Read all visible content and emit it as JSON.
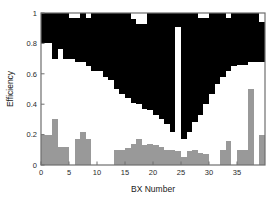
{
  "chart_data": {
    "type": "bar",
    "title": "",
    "subtitle": "",
    "xlabel": "BX Number",
    "ylabel": "Efficiency",
    "xlim": [
      0,
      40
    ],
    "ylim": [
      0,
      1.0
    ],
    "xticks": [
      0,
      5,
      10,
      15,
      20,
      25,
      30,
      35
    ],
    "xtick_labels": [
      "0",
      "5",
      "10",
      "15",
      "20",
      "25",
      "30",
      "35"
    ],
    "yticks": [
      0,
      0.2,
      0.4,
      0.6,
      0.8,
      1
    ],
    "ytick_labels": [
      "0",
      "0.2",
      "0.4",
      "0.6",
      "0.8",
      "1"
    ],
    "grid": false,
    "legend_position": "none",
    "stacked": true,
    "bar_width": 1,
    "colors": {
      "series_gray": "#999999",
      "series_white": "#ffffff",
      "series_black": "#000000",
      "axis": "#6e6e6e",
      "text": "#222222",
      "background": "#ffffff"
    },
    "categories": [
      0,
      1,
      2,
      3,
      4,
      5,
      6,
      7,
      8,
      9,
      10,
      11,
      12,
      13,
      14,
      15,
      16,
      17,
      18,
      19,
      20,
      21,
      22,
      23,
      24,
      25,
      26,
      27,
      28,
      29,
      30,
      31,
      32,
      33,
      34,
      35,
      36,
      37,
      38,
      39
    ],
    "series": [
      {
        "name": "lower-gray-band",
        "color": "#999999",
        "description": "gray filled region measured from y=0 upward",
        "values": [
          0.2,
          0.2,
          0.3,
          0.12,
          0.12,
          0.0,
          0.17,
          0.22,
          0.17,
          0.0,
          0.0,
          0.0,
          0.0,
          0.1,
          0.1,
          0.11,
          0.14,
          0.17,
          0.13,
          0.14,
          0.13,
          0.12,
          0.1,
          0.1,
          0.09,
          0.05,
          0.09,
          0.1,
          0.08,
          0.07,
          0.0,
          0.0,
          0.1,
          0.16,
          0.0,
          0.1,
          0.1,
          0.5,
          0.0,
          0.2
        ]
      },
      {
        "name": "upper-black-band-bottom",
        "color": "#000000",
        "description": "lower boundary of black region (efficiency value where black begins)",
        "values": [
          0.8,
          0.8,
          0.7,
          0.76,
          0.7,
          0.7,
          0.68,
          0.68,
          0.65,
          0.62,
          0.62,
          0.58,
          0.56,
          0.5,
          0.47,
          0.44,
          0.41,
          0.4,
          0.37,
          0.36,
          0.33,
          0.3,
          0.27,
          0.22,
          0.91,
          0.17,
          0.22,
          0.28,
          0.33,
          0.4,
          0.47,
          0.53,
          0.58,
          0.62,
          0.65,
          0.66,
          0.66,
          0.68,
          0.68,
          0.68
        ]
      },
      {
        "name": "upper-black-band-top",
        "color": "#000000",
        "description": "upper boundary of black region (top of stack)",
        "values": [
          1.0,
          1.0,
          1.0,
          1.0,
          1.0,
          0.97,
          0.97,
          1.0,
          0.97,
          1.0,
          1.0,
          1.0,
          1.0,
          1.0,
          1.0,
          1.0,
          0.96,
          0.93,
          0.93,
          1.0,
          1.0,
          1.0,
          1.0,
          1.0,
          1.0,
          1.0,
          1.0,
          1.0,
          0.97,
          0.97,
          1.0,
          1.0,
          1.0,
          0.97,
          1.0,
          1.0,
          1.0,
          1.0,
          1.0,
          0.94
        ]
      }
    ],
    "annotations": [
      {
        "name": "central-white-spike",
        "text": "narrow white gap at BX 24-25 reaching up to ~0.91",
        "x": 24,
        "y": 0.91
      }
    ]
  },
  "axes": {
    "y_axis_title": "Efficiency",
    "x_axis_title": "BX Number"
  }
}
